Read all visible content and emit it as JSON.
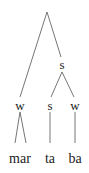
{
  "diagram": {
    "type": "metrical-tree",
    "nodes": {
      "root_right": {
        "label": "s"
      },
      "left": {
        "label": "w"
      },
      "mid": {
        "label": "s"
      },
      "right": {
        "label": "w"
      }
    },
    "leaves": [
      {
        "label": "mar"
      },
      {
        "label": "ta"
      },
      {
        "label": "ba"
      }
    ],
    "line_color": "#666666",
    "text_color": "#222222"
  }
}
